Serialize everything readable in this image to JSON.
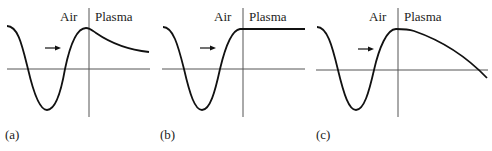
{
  "figure": {
    "panels": [
      {
        "id": "a",
        "caption": "(a)",
        "left_label": "Air",
        "right_label": "Plasma",
        "plasma_behavior": "decaying"
      },
      {
        "id": "b",
        "caption": "(b)",
        "left_label": "Air",
        "right_label": "Plasma",
        "plasma_behavior": "constant"
      },
      {
        "id": "c",
        "caption": "(c)",
        "left_label": "Air",
        "right_label": "Plasma",
        "plasma_behavior": "oscillatory"
      }
    ],
    "arrow_icon": "right-arrow",
    "colors": {
      "curve": "#111111",
      "axis": "#555555",
      "background": "#ffffff"
    }
  }
}
